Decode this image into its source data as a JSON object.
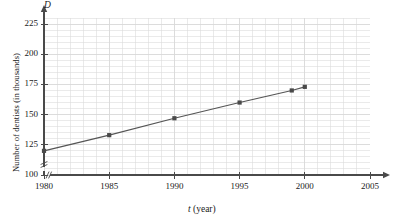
{
  "chart_data": {
    "type": "line",
    "title": "",
    "xlabel": "t (year)",
    "ylabel": "Number of dentists (in thousands)",
    "y_axis_symbol": "D",
    "x_axis_symbol": "t",
    "x_axis_unit": "(year)",
    "x": [
      1980,
      1985,
      1990,
      1995,
      1999,
      2000
    ],
    "values": [
      120,
      133,
      147,
      160,
      170,
      173
    ],
    "xlim": [
      1980,
      2005
    ],
    "ylim": [
      100,
      230
    ],
    "xticks": [
      "1980",
      "1985",
      "1990",
      "1995",
      "2000",
      "2005"
    ],
    "xtick_values": [
      1980,
      1985,
      1990,
      1995,
      2000,
      2005
    ],
    "yticks": [
      "100",
      "125",
      "150",
      "175",
      "200",
      "225"
    ],
    "ytick_values": [
      100,
      125,
      150,
      175,
      200,
      225
    ],
    "x_minor_step": 1,
    "y_minor_step": 5,
    "grid": true,
    "legend": null,
    "axis_break_x": true,
    "axis_break_y": true,
    "line_color": "#555555",
    "marker_color": "#4a4a4a",
    "grid_color": "#d8d8d8",
    "axis_color": "#4a4a4a"
  }
}
